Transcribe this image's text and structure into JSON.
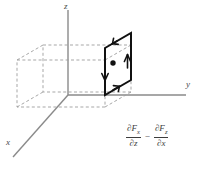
{
  "figure": {
    "type": "3d-vector-field-diagram",
    "axes": {
      "x_label": "x",
      "y_label": "y",
      "z_label": "z",
      "axis_color": "#808080",
      "origin": {
        "x": 68,
        "y": 95
      }
    },
    "box": {
      "style": "dashed",
      "color": "#9a9a9a",
      "vertices": {
        "front_bottom_left": {
          "x": 17,
          "y": 107
        },
        "front_bottom_right": {
          "x": 105,
          "y": 107
        },
        "front_top_left": {
          "x": 17,
          "y": 60
        },
        "front_top_right": {
          "x": 105,
          "y": 60
        },
        "back_bottom_left": {
          "x": 43,
          "y": 92
        },
        "back_bottom_right": {
          "x": 131,
          "y": 92
        },
        "back_top_left": {
          "x": 43,
          "y": 45
        },
        "back_top_right": {
          "x": 131,
          "y": 45
        }
      }
    },
    "highlighted_face": {
      "name": "right-face",
      "color": "#000000",
      "stroke_width": 2,
      "corners": [
        {
          "x": 105,
          "y": 48
        },
        {
          "x": 131,
          "y": 33
        },
        {
          "x": 131,
          "y": 80
        },
        {
          "x": 105,
          "y": 95
        }
      ],
      "center_dot": {
        "x": 113,
        "y": 63,
        "radius": 2.6
      },
      "circulation": "clockwise-viewed-from-positive-y",
      "arrows": [
        {
          "edge": "top",
          "direction": "down-left"
        },
        {
          "edge": "left",
          "direction": "down"
        },
        {
          "edge": "bottom",
          "direction": "up-right"
        },
        {
          "edge": "right",
          "direction": "up"
        }
      ]
    }
  },
  "formula": {
    "expression": "∂F_x/∂z − ∂F_z/∂x",
    "term1": {
      "numerator": "∂F",
      "numerator_sub": "x",
      "denominator": "∂z",
      "denominator_sub": ""
    },
    "operator": "−",
    "term2": {
      "numerator": "∂F",
      "numerator_sub": "z",
      "denominator": "∂x",
      "denominator_sub": ""
    }
  }
}
